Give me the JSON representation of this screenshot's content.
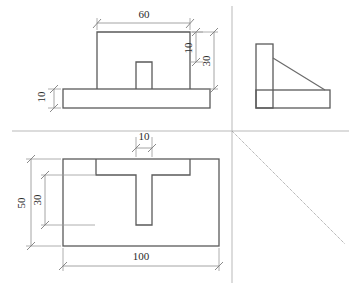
{
  "drawing": {
    "title": "Orthographic Projection - Three View Engineering Drawing",
    "units": "mm",
    "line_color": "#5a5a5a",
    "dim_color": "#8d8d8d",
    "axis_color": "#b9b9b9",
    "background": "#ffffff"
  },
  "views": {
    "front": {
      "name": "Front View",
      "dimensions": [
        {
          "id": "front-width",
          "label": "60",
          "value": 60,
          "orientation": "horizontal",
          "feature": "upright-plate-width"
        },
        {
          "id": "front-slot-depth",
          "label": "10",
          "value": 10,
          "orientation": "vertical",
          "feature": "upright-top-to-slot"
        },
        {
          "id": "front-height",
          "label": "30",
          "value": 30,
          "orientation": "vertical",
          "feature": "upright-plate-height"
        },
        {
          "id": "front-base-thickness",
          "label": "10",
          "value": 10,
          "orientation": "vertical",
          "feature": "base-plate-thickness"
        }
      ]
    },
    "side": {
      "name": "Side View",
      "dimensions": []
    },
    "top": {
      "name": "Top View",
      "dimensions": [
        {
          "id": "top-slot-width",
          "label": "10",
          "value": 10,
          "orientation": "horizontal",
          "feature": "slot-width"
        },
        {
          "id": "top-depth",
          "label": "50",
          "value": 50,
          "orientation": "vertical",
          "feature": "base-plate-depth"
        },
        {
          "id": "top-slot-length",
          "label": "30",
          "value": 30,
          "orientation": "vertical",
          "feature": "slot-length"
        },
        {
          "id": "top-width",
          "label": "100",
          "value": 100,
          "orientation": "horizontal",
          "feature": "base-plate-width"
        }
      ]
    }
  },
  "labels": {
    "d60": "60",
    "d10_front_upper": "10",
    "d30_front": "30",
    "d10_front_base": "10",
    "d10_top": "10",
    "d50_top": "50",
    "d30_top": "30",
    "d100_top": "100"
  }
}
